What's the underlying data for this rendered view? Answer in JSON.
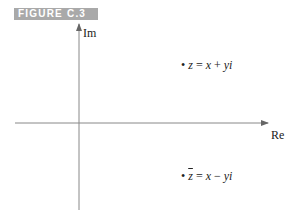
{
  "figure": {
    "label": "FIGURE C.3",
    "axes": {
      "vertical_label": "Im",
      "horizontal_label": "Re"
    },
    "points": [
      {
        "name": "z",
        "dot": "•",
        "lhs": "z",
        "eq": "=",
        "rhs_a": "x",
        "op": "+",
        "rhs_b": "yi"
      },
      {
        "name": "z-conjugate",
        "dot": "•",
        "lhs": "z",
        "eq": "=",
        "rhs_a": "x",
        "op": "−",
        "rhs_b": "yi"
      }
    ],
    "colors": {
      "label_bg": "#a9a9a9",
      "axis": "#777777",
      "text": "#222222"
    }
  }
}
